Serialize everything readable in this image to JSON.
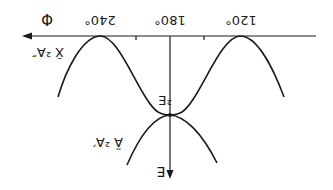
{
  "diagram": {
    "orientation": "rotated 180 degrees",
    "axes": {
      "horizontal_label": "Φ",
      "vertical_label": "E",
      "tick_labels": [
        "240°",
        "180°",
        "120°"
      ]
    },
    "labels": {
      "crossing": "²E",
      "upper_state": "X̃ ²A″",
      "lower_state": "Ã ²A′"
    },
    "colors": {
      "ink": "#1a1a1a",
      "background": "#ffffff"
    }
  }
}
